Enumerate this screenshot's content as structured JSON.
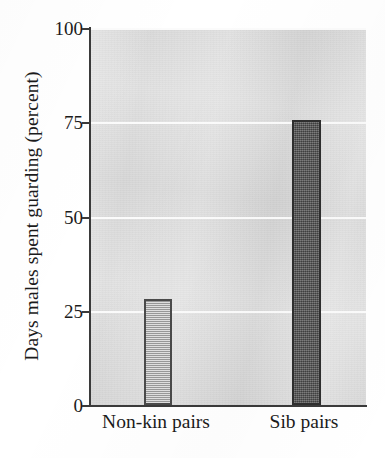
{
  "chart_data": {
    "type": "bar",
    "title": "",
    "subtitle": "",
    "xlabel": "",
    "ylabel": "Days males spent guarding (percent)",
    "categories": [
      "Non-kin pairs",
      "Sib pairs"
    ],
    "values": [
      28,
      75.5
    ],
    "series": [
      {
        "name": "Days males spent guarding",
        "values": [
          28,
          75.5
        ]
      }
    ],
    "ylim": [
      0,
      100
    ],
    "yticks": [
      0,
      25,
      50,
      75,
      100
    ],
    "ytick_labels": [
      "0",
      "25",
      "50",
      "75",
      "100"
    ],
    "grid": true,
    "grid_axis": "y",
    "grid_color": "#fbfbfb",
    "legend": false,
    "legend_position": "none",
    "plot_background": "#dcdcdc",
    "axis_color": "#3a3a3a",
    "bar_styles": [
      {
        "category": "Non-kin pairs",
        "fill": "#b9b9b9",
        "pattern": "horizontal-hatch",
        "edge": "#4a4a4a"
      },
      {
        "category": "Sib pairs",
        "fill": "#595959",
        "pattern": "stipple",
        "edge": "#2e2e2e"
      }
    ],
    "annotations": []
  }
}
